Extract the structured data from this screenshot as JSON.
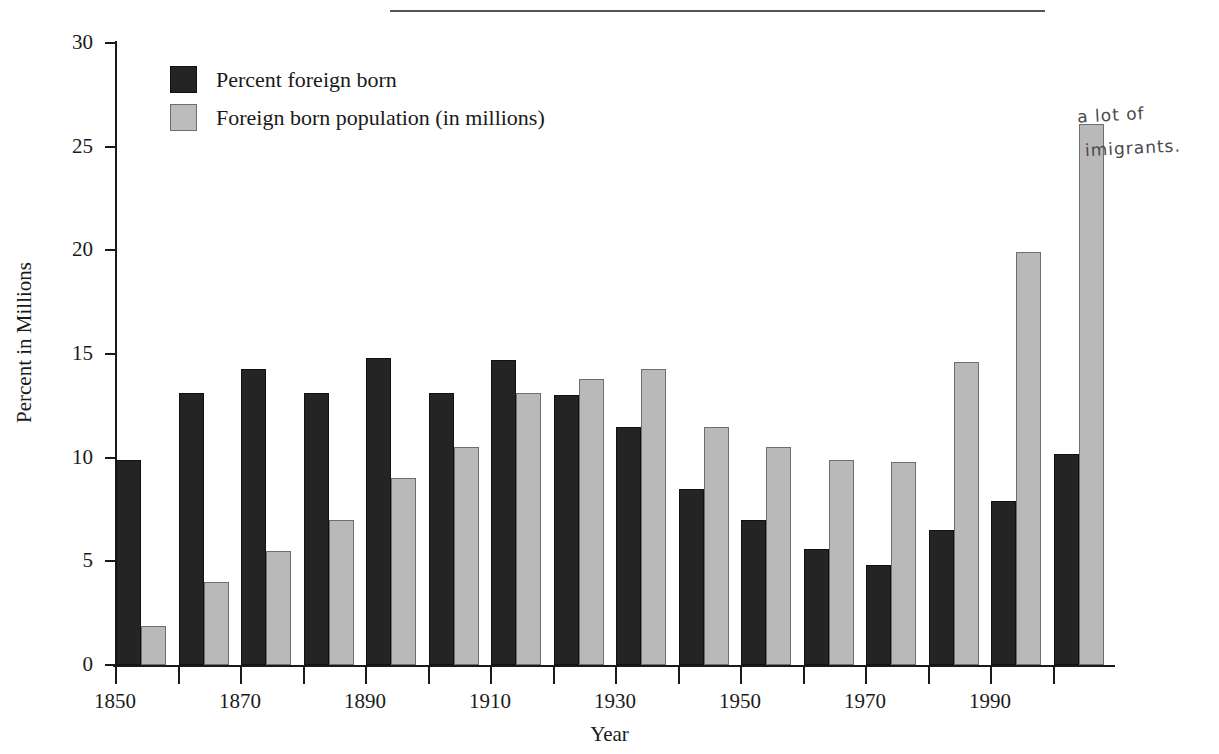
{
  "figure": {
    "top_rule": true,
    "annotation": {
      "line1": "a lot of",
      "line2": "imigrants."
    }
  },
  "legend": {
    "position": "top-left-inside",
    "items": [
      {
        "key": "dark",
        "label": "Percent foreign born",
        "color": "#242424"
      },
      {
        "key": "light",
        "label": "Foreign born population (in millions)",
        "color": "#b9b9b9"
      }
    ]
  },
  "chart_data": {
    "type": "bar",
    "title": "",
    "xlabel": "Year",
    "ylabel": "Percent in Millions",
    "ylim": [
      0,
      30
    ],
    "yticks": [
      0,
      5,
      10,
      15,
      20,
      25,
      30
    ],
    "ytick_labels": [
      "0",
      "5",
      "10",
      "15",
      "20",
      "25",
      "30"
    ],
    "grid": false,
    "legend_position": "upper left",
    "categories": [
      1850,
      1860,
      1870,
      1880,
      1890,
      1900,
      1910,
      1920,
      1930,
      1940,
      1950,
      1960,
      1970,
      1980,
      1990,
      2000
    ],
    "xtick_labels": [
      "1850",
      "",
      "1870",
      "",
      "1890",
      "",
      "1910",
      "",
      "1930",
      "",
      "1950",
      "",
      "1970",
      "",
      "1990",
      ""
    ],
    "series": [
      {
        "name": "Percent foreign born",
        "color": "#242424",
        "values": [
          9.9,
          13.1,
          14.3,
          13.1,
          14.8,
          13.1,
          14.7,
          13.0,
          11.5,
          8.5,
          7.0,
          5.6,
          4.8,
          6.5,
          7.9,
          10.2
        ]
      },
      {
        "name": "Foreign born population (in millions)",
        "color": "#b9b9b9",
        "values": [
          1.9,
          4.0,
          5.5,
          7.0,
          9.0,
          10.5,
          13.1,
          13.8,
          14.3,
          11.5,
          10.5,
          9.9,
          9.8,
          14.6,
          19.9,
          26.1
        ]
      }
    ]
  }
}
